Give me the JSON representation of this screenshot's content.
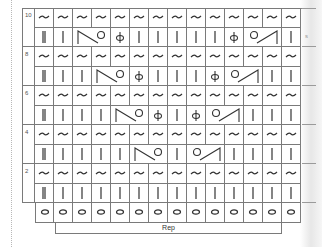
{
  "chart": {
    "rows_labeled": [
      "10",
      "8",
      "6",
      "4",
      "2"
    ],
    "columns": 14,
    "rep_label": "Rep",
    "side_text": "s",
    "legend_symbols": {
      "~": "twisted/tilde stitch (wrong-side row)",
      "|": "knit",
      "||": "edge/selvedge stitch",
      "phi": "knit through back loop (twisted)",
      "dec-left": "left-slanting decrease with yarn over",
      "dec-right": "yarn over with right-slanting decrease",
      "o": "purl/bead stitch"
    },
    "rows": [
      {
        "label": "10",
        "odd": [
          "||",
          "|",
          "dec-left-start",
          "dec-left-end",
          "phi",
          "|",
          "|",
          "|",
          "|",
          "|",
          "phi",
          "dec-right-start",
          "dec-right-end",
          "|"
        ]
      },
      {
        "label": "8",
        "odd": [
          "||",
          "|",
          "|",
          "dec-left-start",
          "dec-left-end",
          "phi",
          "|",
          "|",
          "|",
          "phi",
          "dec-right-start",
          "dec-right-end",
          "|",
          "|"
        ]
      },
      {
        "label": "6",
        "odd": [
          "||",
          "|",
          "|",
          "|",
          "dec-left-start",
          "dec-left-end",
          "phi",
          "|",
          "phi",
          "dec-right-start",
          "dec-right-end",
          "|",
          "|",
          "|"
        ]
      },
      {
        "label": "4",
        "odd": [
          "||",
          "|",
          "|",
          "|",
          "|",
          "dec-left-start",
          "dec-left-end",
          "|",
          "dec-right-start",
          "dec-right-end",
          "|",
          "|",
          "|",
          "|"
        ]
      },
      {
        "label": "2",
        "odd": [
          "||",
          "|",
          "|",
          "|",
          "|",
          "|",
          "|",
          "|",
          "|",
          "|",
          "|",
          "|",
          "|",
          "|"
        ]
      }
    ],
    "bottom_row": [
      "o",
      "o",
      "o",
      "o",
      "o",
      "o",
      "o",
      "o",
      "o",
      "o",
      "o",
      "o",
      "o",
      "o"
    ]
  }
}
